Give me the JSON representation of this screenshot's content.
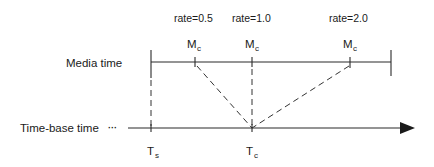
{
  "diagram": {
    "media_axis": {
      "label": "Media time"
    },
    "timebase_axis": {
      "label": "Time-base time",
      "ellipsis": "···"
    },
    "media_markers": [
      {
        "rate_label": "rate=0.5",
        "symbol": "M",
        "subscript": "c"
      },
      {
        "rate_label": "rate=1.0",
        "symbol": "M",
        "subscript": "c"
      },
      {
        "rate_label": "rate=2.0",
        "symbol": "M",
        "subscript": "c"
      }
    ],
    "timebase_markers": [
      {
        "symbol": "T",
        "subscript": "s"
      },
      {
        "symbol": "T",
        "subscript": "c"
      }
    ],
    "colors": {
      "line": "#2a2a2a",
      "text": "#1a1a1a",
      "background": "#ffffff"
    }
  }
}
